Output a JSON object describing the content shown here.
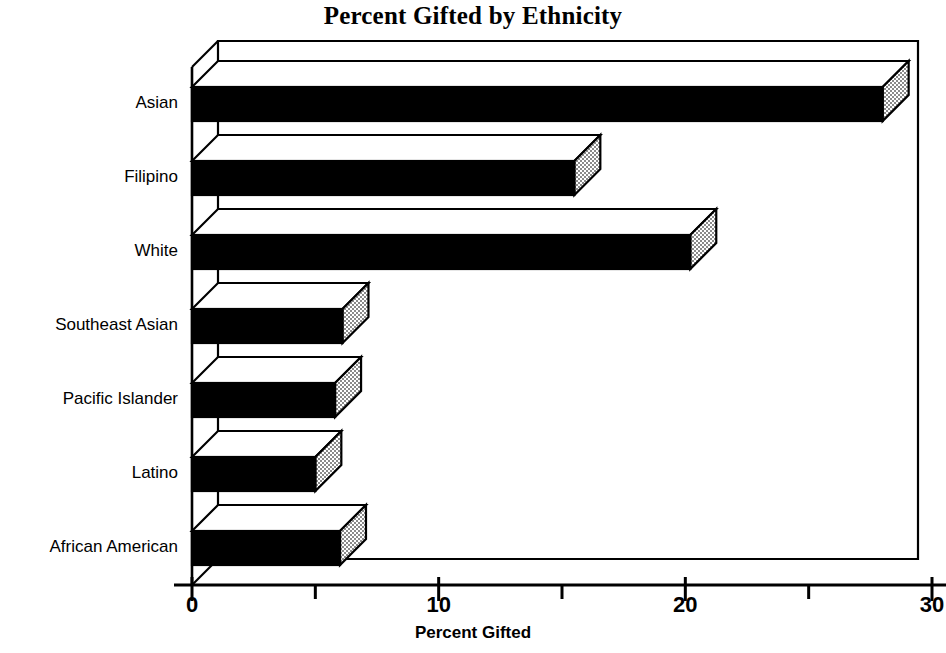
{
  "chart_data": {
    "type": "bar",
    "orientation": "horizontal",
    "title": "Percent Gifted by Ethnicity",
    "xlabel": "Percent Gifted",
    "ylabel": "",
    "categories": [
      "Asian",
      "Filipino",
      "White",
      "Southeast Asian",
      "Pacific Islander",
      "Latino",
      "African American"
    ],
    "values": [
      28.0,
      15.5,
      20.2,
      6.1,
      5.8,
      5.0,
      6.0
    ],
    "xlim": [
      0,
      30
    ],
    "xticks": [
      0,
      10,
      20,
      30
    ],
    "xtick_labels": [
      "0",
      "10",
      "20",
      "30"
    ],
    "xticks_minor": [
      5,
      15,
      25
    ],
    "grid": false,
    "legend": null,
    "style": {
      "bar_front_color": "#000000",
      "bar_top_color": "#ffffff",
      "bar_side_color": "#b8b8b8",
      "outline_color": "#000000",
      "background": "#ffffff",
      "effect": "3d-extruded"
    }
  }
}
